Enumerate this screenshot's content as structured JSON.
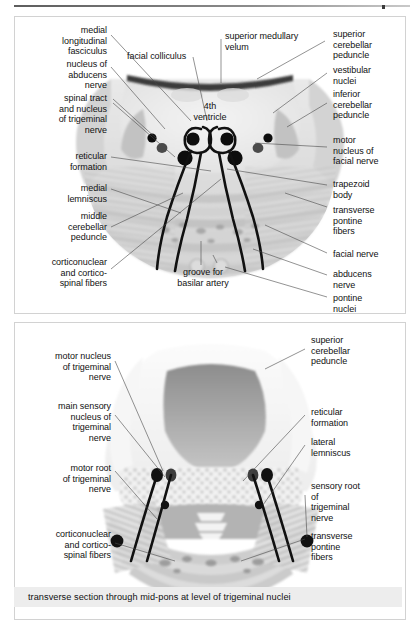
{
  "figure": {
    "top_panel": {
      "caption": "transverse section  through caudal pons at level of facial colliculus",
      "labels_left": [
        {
          "text": "medial\nlongitudinal\nfasciculus"
        },
        {
          "text": "nucleus of\nabducens\nnerve"
        },
        {
          "text": "spinal tract\nand nucleus\nof trigeminal\nnerve"
        },
        {
          "text": "reticular\nformation"
        },
        {
          "text": "medial\nlemniscus"
        },
        {
          "text": "middle\ncerebellar\npeduncle"
        },
        {
          "text": "corticonuclear\nand cortico-\nspinal fibers"
        }
      ],
      "labels_right": [
        {
          "text": "superior\ncerebellar\npeduncle"
        },
        {
          "text": "vestibular\nnuclei"
        },
        {
          "text": "inferior\ncerebellar\npeduncle"
        },
        {
          "text": "motor\nnucleus of\nfacial nerve"
        },
        {
          "text": "trapezoid\nbody"
        },
        {
          "text": "transverse\npontine\nfibers"
        },
        {
          "text": "facial nerve"
        },
        {
          "text": "abducens\nnerve"
        },
        {
          "text": "pontine\nnuclei"
        }
      ],
      "labels_center": [
        {
          "text": "facial colliculus"
        },
        {
          "text": "superior medullary\nvelum"
        },
        {
          "text": "4th\nventricle"
        },
        {
          "text": "groove for\nbasilar artery"
        }
      ]
    },
    "bottom_panel": {
      "caption": "transverse section through mid-pons at level of trigeminal nuclei",
      "labels_left": [
        {
          "text": "motor nucleus\nof trigeminal\nnerve"
        },
        {
          "text": "main sensory\nnucleus of\ntrigeminal\nnerve"
        },
        {
          "text": "motor root\nof trigeminal\nnerve"
        },
        {
          "text": "corticonuclear\nand cortico-\nspinal fibers"
        }
      ],
      "labels_right": [
        {
          "text": "superior\ncerebellar\npeduncle"
        },
        {
          "text": "reticular\nformation"
        },
        {
          "text": "lateral\nlemniscus"
        },
        {
          "text": "sensory root\nof\n trigeminal\nnerve"
        },
        {
          "text": "transverse\npontine\nfibers"
        }
      ]
    }
  },
  "colors": {
    "caption_bg": "#ededed",
    "panel_border": "#d2d2d2",
    "leader_line": "#4a4a4a",
    "nerve_tract": "#111111",
    "text": "#111111"
  }
}
